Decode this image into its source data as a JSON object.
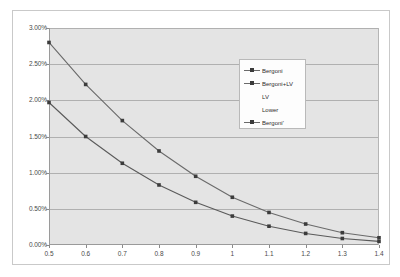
{
  "chart_data": {
    "type": "line",
    "title": "",
    "subtitle": "",
    "xlabel": "",
    "ylabel": "",
    "x": [
      0.5,
      0.6,
      0.7,
      0.8,
      0.9,
      1.0,
      1.1,
      1.2,
      1.3,
      1.4
    ],
    "xlim": [
      0.5,
      1.4
    ],
    "ylim": [
      0.0,
      3.0
    ],
    "y_tick_labels": [
      "0.00%",
      "0.50%",
      "1.00%",
      "1.50%",
      "2.00%",
      "2.50%",
      "3.00%"
    ],
    "y_tick_values": [
      0.0,
      0.5,
      1.0,
      1.5,
      2.0,
      2.5,
      3.0
    ],
    "x_tick_labels": [
      "0.5",
      "0.6",
      "0.7",
      "0.8",
      "0.9",
      "1",
      "1.1",
      "1.2",
      "1.3",
      "1.4"
    ],
    "x_tick_values": [
      0.5,
      0.6,
      0.7,
      0.8,
      0.9,
      1.0,
      1.1,
      1.2,
      1.3,
      1.4
    ],
    "grid": true,
    "grid_axis": "y",
    "legend_position": "inside-upper-right",
    "plot_background": "#e4e4e4",
    "series": [
      {
        "name": "Bergoni",
        "color": "#6a6a6a",
        "marker": "square",
        "values": [
          2.8,
          2.22,
          1.72,
          1.3,
          0.95,
          0.66,
          0.45,
          0.29,
          0.17,
          0.1
        ]
      },
      {
        "name": "Bergoni+LV",
        "color": "#5a5a5a",
        "marker": "square",
        "values": [
          1.97,
          1.5,
          1.13,
          0.83,
          0.59,
          0.4,
          0.26,
          0.16,
          0.09,
          0.05
        ]
      }
    ],
    "legend_entries": [
      {
        "label": "Bergoni",
        "has_marker": true
      },
      {
        "label": "Bergoni+LV",
        "has_marker": true
      },
      {
        "label": "LV",
        "has_marker": false
      },
      {
        "label": "Lower",
        "has_marker": false
      },
      {
        "label": "Bergoni'",
        "has_marker": true
      }
    ]
  }
}
